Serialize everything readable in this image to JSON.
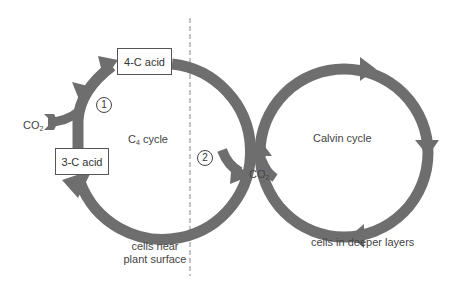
{
  "diagram": {
    "type": "photosynthesis-c4-pathway",
    "colors": {
      "arrow": "#6e6e6e",
      "box_border": "#555555",
      "text": "#444444",
      "divider": "#888888"
    },
    "c4_cycle": {
      "title": "C",
      "title_sub": "4",
      "title_rest": " cycle",
      "boxes": {
        "top": "4-C acid",
        "left": "3-C acid"
      },
      "steps": {
        "one": "1",
        "two": "2"
      },
      "co2_in": {
        "text": "CO",
        "sub": "2"
      },
      "region_label_line1": "cells near",
      "region_label_line2": "plant surface"
    },
    "calvin_cycle": {
      "title": "Calvin cycle",
      "co2_in": {
        "text": "CO",
        "sub": "2"
      },
      "region_label": "cells in deeper layers"
    }
  }
}
